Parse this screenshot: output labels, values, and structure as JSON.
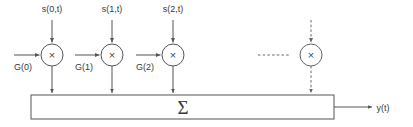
{
  "diagram": {
    "colors": {
      "background": "#ffffff",
      "stroke": "#555555",
      "stroke_dashed": "#666666",
      "text": "#3a3a3a"
    },
    "signal_labels": [
      {
        "text": "s(0,t)",
        "x": 52,
        "y": 12
      },
      {
        "text": "s(1,t)",
        "x": 112,
        "y": 12
      },
      {
        "text": "s(2,t)",
        "x": 173,
        "y": 12
      }
    ],
    "gain_labels": [
      {
        "text": "G(0)",
        "x": 23,
        "y": 70
      },
      {
        "text": "G(1)",
        "x": 84,
        "y": 70
      },
      {
        "text": "G(2)",
        "x": 145,
        "y": 70
      }
    ],
    "multipliers": [
      {
        "symbol": "×",
        "cx": 52,
        "cy": 55,
        "r": 11,
        "style": "solid"
      },
      {
        "symbol": "×",
        "cx": 112,
        "cy": 55,
        "r": 11,
        "style": "solid"
      },
      {
        "symbol": "×",
        "cx": 173,
        "cy": 55,
        "r": 11,
        "style": "solid"
      },
      {
        "symbol": "×",
        "cx": 311,
        "cy": 55,
        "r": 11,
        "style": "dashed"
      }
    ],
    "ellipsis": {
      "x1": 258,
      "x2": 289,
      "y": 55,
      "style": "dashed"
    },
    "summation": {
      "symbol": "Σ",
      "x": 31,
      "y": 95,
      "width": 303,
      "height": 24,
      "label_cx": 183,
      "label_cy": 113
    },
    "output": {
      "text": "y(t)",
      "x": 383,
      "y": 111,
      "arrow_from_x": 334,
      "arrow_to_x": 372,
      "arrow_y": 107
    }
  }
}
